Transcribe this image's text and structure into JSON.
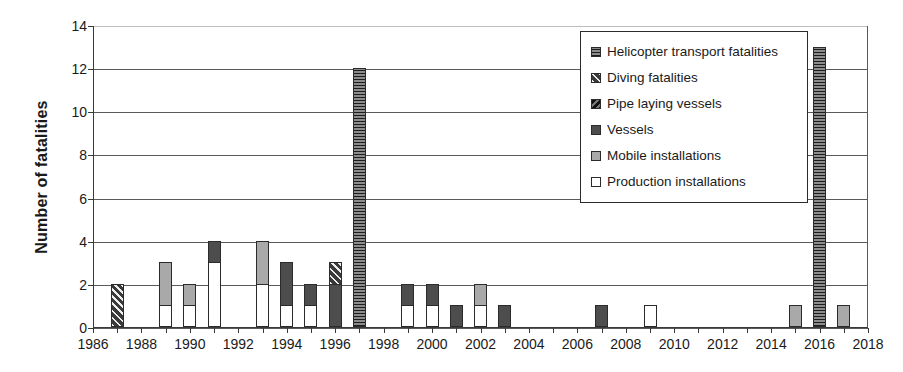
{
  "chart_data": {
    "type": "bar",
    "title": "",
    "xlabel": "",
    "ylabel": "Number of fatalities",
    "ylim": [
      0,
      14
    ],
    "ytick_step": 2,
    "ytick_labels": [
      "0",
      "2",
      "4",
      "6",
      "8",
      "10",
      "12",
      "14"
    ],
    "xlim": [
      1986,
      2018
    ],
    "xtick_labels": [
      "1986",
      "1988",
      "1990",
      "1992",
      "1994",
      "1996",
      "1998",
      "2000",
      "2002",
      "2004",
      "2006",
      "2008",
      "2010",
      "2012",
      "2014",
      "2016",
      "2018"
    ],
    "grid": "horizontal",
    "stacked": true,
    "legend_position": "upper-right-inside",
    "x": [
      1986,
      1987,
      1988,
      1989,
      1990,
      1991,
      1992,
      1993,
      1994,
      1995,
      1996,
      1997,
      1998,
      1999,
      2000,
      2001,
      2002,
      2003,
      2004,
      2005,
      2006,
      2007,
      2008,
      2009,
      2010,
      2011,
      2012,
      2013,
      2014,
      2015,
      2016,
      2017,
      2018
    ],
    "series": [
      {
        "name": "Helicopter transport fatalities",
        "key": "helicopter",
        "color": "#4a4a4a",
        "pattern": "horizontal-lines",
        "values": [
          0,
          0,
          0,
          0,
          0,
          0,
          0,
          0,
          0,
          0,
          0,
          12,
          0,
          0,
          0,
          0,
          0,
          0,
          0,
          0,
          0,
          0,
          0,
          0,
          0,
          0,
          0,
          0,
          0,
          0,
          13,
          0,
          0
        ]
      },
      {
        "name": "Diving fatalities",
        "key": "diving",
        "color": "#4f4f4f",
        "pattern": "diagonal-hatch",
        "values": [
          0,
          2,
          0,
          0,
          0,
          0,
          0,
          0,
          0,
          0,
          1,
          0,
          0,
          0,
          0,
          0,
          0,
          0,
          0,
          0,
          0,
          0,
          0,
          0,
          0,
          0,
          0,
          0,
          0,
          0,
          0,
          0,
          0
        ]
      },
      {
        "name": "Pipe laying vessels",
        "key": "pipe",
        "color": "#3d3d3d",
        "pattern": "dense-diagonal",
        "values": [
          0,
          0,
          0,
          0,
          0,
          0,
          0,
          0,
          0,
          0,
          0,
          0,
          0,
          0,
          0,
          0,
          0,
          0,
          0,
          0,
          0,
          0,
          0,
          0,
          0,
          0,
          0,
          0,
          0,
          0,
          0,
          0,
          0
        ]
      },
      {
        "name": "Vessels",
        "key": "vessels",
        "color": "#4d4d4d",
        "pattern": "solid-dark",
        "values": [
          0,
          0,
          0,
          0,
          0,
          1,
          0,
          0,
          2,
          1,
          2,
          0,
          0,
          1,
          1,
          1,
          0,
          1,
          0,
          0,
          0,
          1,
          0,
          0,
          0,
          0,
          0,
          0,
          0,
          0,
          0,
          0,
          0
        ]
      },
      {
        "name": "Mobile installations",
        "key": "mobile",
        "color": "#a9a9a9",
        "pattern": "solid-gray",
        "values": [
          0,
          0,
          0,
          2,
          1,
          0,
          0,
          2,
          0,
          0,
          0,
          0,
          0,
          0,
          0,
          0,
          1,
          0,
          0,
          0,
          0,
          0,
          0,
          0,
          0,
          0,
          0,
          0,
          0,
          1,
          0,
          1,
          0
        ]
      },
      {
        "name": "Production installations",
        "key": "production",
        "color": "#ffffff",
        "pattern": "solid-white",
        "values": [
          0,
          0,
          0,
          1,
          1,
          3,
          0,
          2,
          1,
          1,
          0,
          0,
          0,
          1,
          1,
          0,
          1,
          0,
          0,
          0,
          0,
          0,
          0,
          1,
          0,
          0,
          0,
          0,
          0,
          0,
          0,
          0,
          0
        ]
      }
    ]
  }
}
